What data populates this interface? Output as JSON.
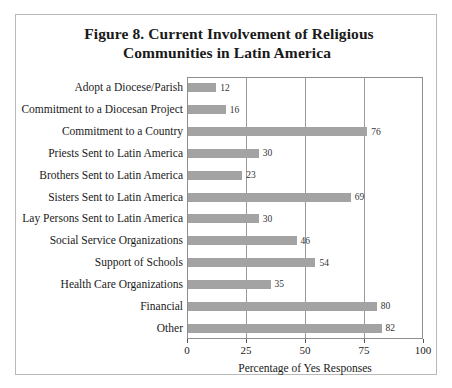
{
  "figure": {
    "title_line_1": "Figure 8.  Current Involvement of Religious",
    "title_line_2": "Communities in Latin America"
  },
  "chart_data": {
    "type": "bar",
    "orientation": "horizontal",
    "title": "Figure 8.  Current Involvement of Religious Communities in Latin America",
    "xlabel": "Percentage of Yes Responses",
    "ylabel": "",
    "xlim": [
      0,
      100
    ],
    "xticks": [
      0,
      25,
      50,
      75,
      100
    ],
    "xtick_labels": [
      "0",
      "25",
      "50",
      "75",
      "100"
    ],
    "grid": true,
    "legend": false,
    "bar_color": "#a3a3a3",
    "categories": [
      "Adopt a Diocese/Parish",
      "Commitment to a Diocesan Project",
      "Commitment to a Country",
      "Priests Sent to Latin America",
      "Brothers Sent to Latin America",
      "Sisters Sent to Latin America",
      "Lay Persons Sent to Latin America",
      "Social Service Organizations",
      "Support of Schools",
      "Health Care Organizations",
      "Financial",
      "Other"
    ],
    "values": [
      12,
      16,
      76,
      30,
      23,
      69,
      30,
      46,
      54,
      35,
      80,
      82
    ],
    "value_labels": [
      "12",
      "16",
      "76",
      "30",
      "23",
      "69",
      "30",
      "46",
      "54",
      "35",
      "80",
      "82"
    ]
  }
}
